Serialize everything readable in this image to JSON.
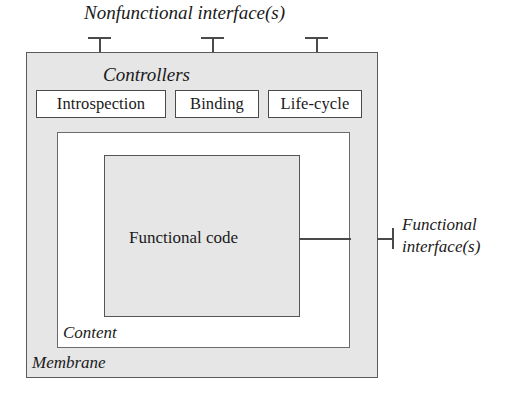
{
  "diagram": {
    "title": "Nonfunctional interface(s)",
    "outer_container": {
      "label": "Membrane",
      "fill_color": "#e6e6e6",
      "border_color": "#5a5a5a"
    },
    "content_container": {
      "label": "Content",
      "fill_color": "#ffffff",
      "border_color": "#6a6a6a"
    },
    "core_component": {
      "label": "Functional code",
      "fill_color": "#e6e6e6",
      "border_color": "#555555"
    },
    "controllers": {
      "group_label": "Controllers",
      "items": [
        {
          "label": "Introspection"
        },
        {
          "label": "Binding"
        },
        {
          "label": "Life-cycle"
        }
      ]
    },
    "functional_interface": {
      "line1": "Functional",
      "line2": "interface(s)"
    },
    "colors": {
      "background": "#ffffff",
      "stroke": "#4a4a4a",
      "text": "#1a1a1a"
    }
  }
}
